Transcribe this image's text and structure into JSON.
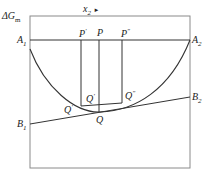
{
  "diagram": {
    "y_axis_label": "ΔG",
    "y_axis_sub": "m",
    "x_axis_label": "x",
    "x_axis_sub": "2",
    "x_arrow": "►",
    "points": {
      "A1": {
        "base": "A",
        "sub": "1"
      },
      "A2": {
        "base": "A",
        "sub": "2"
      },
      "B1": {
        "base": "B",
        "sub": "1"
      },
      "B2": {
        "base": "B",
        "sub": "2"
      },
      "P_prime": {
        "base": "P",
        "sup": "′"
      },
      "P": {
        "base": "P"
      },
      "P_dprime": {
        "base": "P",
        "sup": "″"
      },
      "Q_prime": {
        "base": "Q",
        "sup": "′"
      },
      "Q_prime_inner": {
        "base": "Q",
        "sup": "′"
      },
      "Q": {
        "base": "Q"
      },
      "Q_dprime": {
        "base": "Q",
        "sup": "″"
      }
    },
    "colors": {
      "frame": "#8a8a8a",
      "line": "#333333",
      "text": "#222222"
    }
  }
}
